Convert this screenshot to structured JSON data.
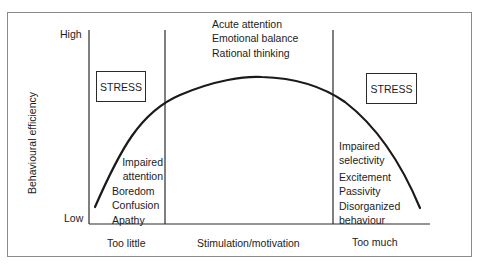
{
  "diagram": {
    "type": "inverted-u curve (Yerkes-Dodson)",
    "y_axis": {
      "label": "Behavioural efficiency",
      "high_label": "High",
      "low_label": "Low"
    },
    "x_axis": {
      "labels": [
        "Too little",
        "Stimulation/motivation",
        "Too much"
      ]
    },
    "top_zone": {
      "lines": [
        "Acute attention",
        "Emotional balance",
        "Rational thinking"
      ]
    },
    "left_zone": {
      "stress_label": "STRESS",
      "lines_right_aligned": [
        "Impaired",
        "attention"
      ],
      "lines": [
        "Boredom",
        "Confusion",
        "Apathy"
      ]
    },
    "right_zone": {
      "stress_label": "STRESS",
      "lines": [
        "Impaired",
        "selectivity",
        "Excitement",
        "Passivity",
        "Disorganized",
        "behaviour"
      ]
    },
    "colors": {
      "line": "#1a1a1a",
      "frame": "#8a8a8a",
      "background": "#ffffff"
    }
  }
}
